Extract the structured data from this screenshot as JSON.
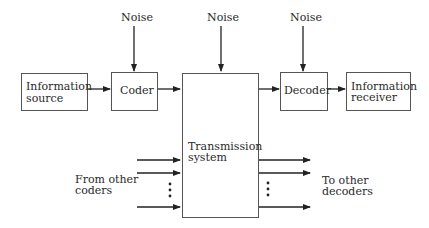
{
  "diagram": {
    "type": "block-diagram",
    "noise_labels": [
      "Noise",
      "Noise",
      "Noise"
    ],
    "blocks": {
      "info_source": {
        "line1": "Information",
        "line2": "source"
      },
      "coder": {
        "label": "Coder"
      },
      "transmission": {
        "line1": "Transmission",
        "line2": "system"
      },
      "decoder": {
        "label": "Decoder"
      },
      "info_receiver": {
        "line1": "Information",
        "line2": "receiver"
      }
    },
    "inputs_label": {
      "line1": "From other",
      "line2": "coders"
    },
    "outputs_label": {
      "line1": "To other",
      "line2": "decoders"
    },
    "ellipsis": "⋮",
    "colors": {
      "line": "#333333",
      "box_border": "#555555",
      "text": "#2a2a2a"
    }
  }
}
